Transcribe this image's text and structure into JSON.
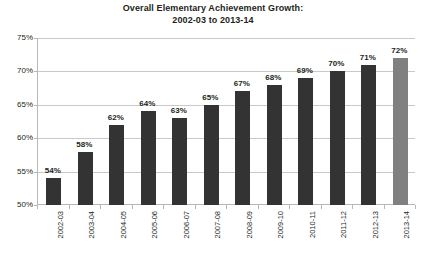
{
  "chart_data": {
    "type": "bar",
    "title": "Overall Elementary Achievement Growth: 2002-03 to 2013-14",
    "title_line1": "Overall Elementary Achievement Growth:",
    "title_line2": "2002-03 to 2013-14",
    "xlabel": "",
    "ylabel": "",
    "ylim": [
      50,
      75
    ],
    "grid": true,
    "legend": "none",
    "categories": [
      "2002-03",
      "2003-04",
      "2004-05",
      "2005-06",
      "2006-07",
      "2007-08",
      "2008-09",
      "2009-10",
      "2010-11",
      "2011-12",
      "2012-13",
      "2013-14"
    ],
    "values": [
      54,
      58,
      62,
      64,
      63,
      65,
      67,
      68,
      69,
      70,
      71,
      72
    ],
    "data_labels": [
      "54%",
      "58%",
      "62%",
      "64%",
      "63%",
      "65%",
      "67%",
      "68%",
      "69%",
      "70%",
      "71%",
      "72%"
    ],
    "y_ticks": [
      50,
      55,
      60,
      65,
      70,
      75
    ],
    "y_tick_labels": [
      "50%",
      "55%",
      "60%",
      "65%",
      "70%",
      "75%"
    ],
    "bar_color": "#333333",
    "highlight_bar_color": "#808080",
    "highlight_index": 11,
    "gridline_color": "#c9c9c9",
    "axis_color": "#b8b8b8",
    "background_color": "#ffffff"
  }
}
